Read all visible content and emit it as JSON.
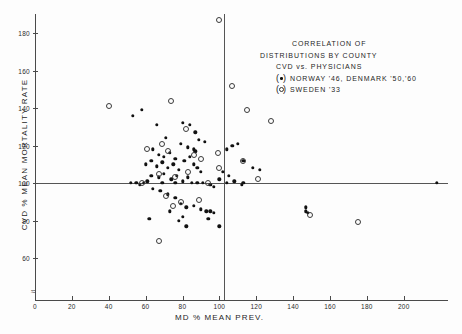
{
  "chart_data": {
    "type": "scatter",
    "title": "CORRELATION OF DISTRIBUTIONS BY COUNTY CVD vs. PHYSICIANS",
    "xlabel": "MD % MEAN PREV.",
    "ylabel": "CVD % MEAN MORTALITY RATE",
    "xlim": [
      0,
      220
    ],
    "ylim": [
      55,
      190
    ],
    "xticks": [
      0,
      20,
      40,
      60,
      80,
      100,
      120,
      140,
      160,
      180,
      200
    ],
    "xtick_labels": [
      "0",
      "20",
      "40",
      "60",
      "80",
      "100",
      "120",
      "140",
      "160",
      "180",
      "200"
    ],
    "yticks": [
      60,
      80,
      100,
      120,
      140,
      160,
      180
    ],
    "ytick_labels": [
      "60",
      "80",
      "100",
      "120",
      "140",
      "160",
      "180"
    ],
    "grid": false,
    "reference_lines": {
      "horizontal": 100,
      "vertical": 100
    },
    "axis_break": "y-axis break below 60",
    "legend_position": "upper right",
    "series": [
      {
        "name": "NORWAY '46, DENMARK '50,'60",
        "marker": "filled-circle",
        "points": [
          [
            53,
            136
          ],
          [
            58,
            139
          ],
          [
            66,
            131
          ],
          [
            80,
            132
          ],
          [
            84,
            131
          ],
          [
            71,
            124
          ],
          [
            79,
            121
          ],
          [
            83,
            119
          ],
          [
            86,
            118
          ],
          [
            87,
            117
          ],
          [
            64,
            118
          ],
          [
            67,
            115
          ],
          [
            70,
            114
          ],
          [
            73,
            116
          ],
          [
            76,
            113
          ],
          [
            60,
            110
          ],
          [
            63,
            112
          ],
          [
            66,
            109
          ],
          [
            69,
            111
          ],
          [
            72,
            108
          ],
          [
            75,
            110
          ],
          [
            78,
            107
          ],
          [
            81,
            112
          ],
          [
            84,
            114
          ],
          [
            86,
            110
          ],
          [
            88,
            108
          ],
          [
            90,
            106
          ],
          [
            63,
            104
          ],
          [
            67,
            103
          ],
          [
            70,
            105
          ],
          [
            74,
            102
          ],
          [
            77,
            104
          ],
          [
            80,
            101
          ],
          [
            83,
            103
          ],
          [
            85,
            100
          ],
          [
            52,
            100
          ],
          [
            55,
            100
          ],
          [
            57,
            99
          ],
          [
            59,
            100
          ],
          [
            61,
            101
          ],
          [
            88,
            100
          ],
          [
            91,
            100
          ],
          [
            95,
            99
          ],
          [
            97,
            98
          ],
          [
            100,
            102
          ],
          [
            104,
            100
          ],
          [
            108,
            101
          ],
          [
            112,
            99
          ],
          [
            64,
            97
          ],
          [
            68,
            96
          ],
          [
            72,
            94
          ],
          [
            76,
            92
          ],
          [
            79,
            89
          ],
          [
            82,
            87
          ],
          [
            86,
            88
          ],
          [
            90,
            86
          ],
          [
            93,
            85
          ],
          [
            95,
            85
          ],
          [
            97,
            84
          ],
          [
            62,
            81
          ],
          [
            73,
            85
          ],
          [
            78,
            80
          ],
          [
            80,
            82
          ],
          [
            82,
            77
          ],
          [
            94,
            81
          ],
          [
            100,
            77
          ],
          [
            104,
            118
          ],
          [
            107,
            120
          ],
          [
            110,
            121
          ],
          [
            113,
            112
          ],
          [
            118,
            108
          ],
          [
            122,
            107
          ],
          [
            113,
            100
          ],
          [
            147,
            87
          ],
          [
            147,
            85
          ],
          [
            148,
            84
          ],
          [
            218,
            100
          ],
          [
            89,
            123
          ],
          [
            92,
            122
          ],
          [
            87,
            127
          ],
          [
            76,
            100
          ],
          [
            69,
            100
          ],
          [
            102,
            106
          ],
          [
            105,
            104
          ]
        ]
      },
      {
        "name": "SWEDEN '33",
        "marker": "open-circle",
        "points": [
          [
            40,
            141
          ],
          [
            74,
            144
          ],
          [
            100,
            187
          ],
          [
            107,
            152
          ],
          [
            115,
            139
          ],
          [
            128,
            133
          ],
          [
            69,
            121
          ],
          [
            82,
            129
          ],
          [
            61,
            118
          ],
          [
            72,
            117
          ],
          [
            86,
            115
          ],
          [
            90,
            113
          ],
          [
            99,
            116
          ],
          [
            113,
            112
          ],
          [
            67,
            105
          ],
          [
            76,
            103
          ],
          [
            83,
            106
          ],
          [
            71,
            93
          ],
          [
            79,
            90
          ],
          [
            75,
            88
          ],
          [
            67,
            69
          ],
          [
            89,
            91
          ],
          [
            100,
            108
          ],
          [
            121,
            102
          ],
          [
            149,
            83
          ],
          [
            175,
            79
          ],
          [
            94,
            100
          ],
          [
            58,
            100
          ]
        ]
      }
    ]
  },
  "legend": {
    "line1": "CORRELATION OF",
    "line2": "DISTRIBUTIONS BY COUNTY",
    "line3": "CVD vs. PHYSICIANS",
    "entry1": "NORWAY '46, DENMARK '50,'60",
    "entry2": "SWEDEN '33"
  },
  "axes": {
    "y_title": "CVD % MEAN MORTALITY RATE",
    "x_title": "MD % MEAN PREV.",
    "break_symbol": "≈"
  }
}
